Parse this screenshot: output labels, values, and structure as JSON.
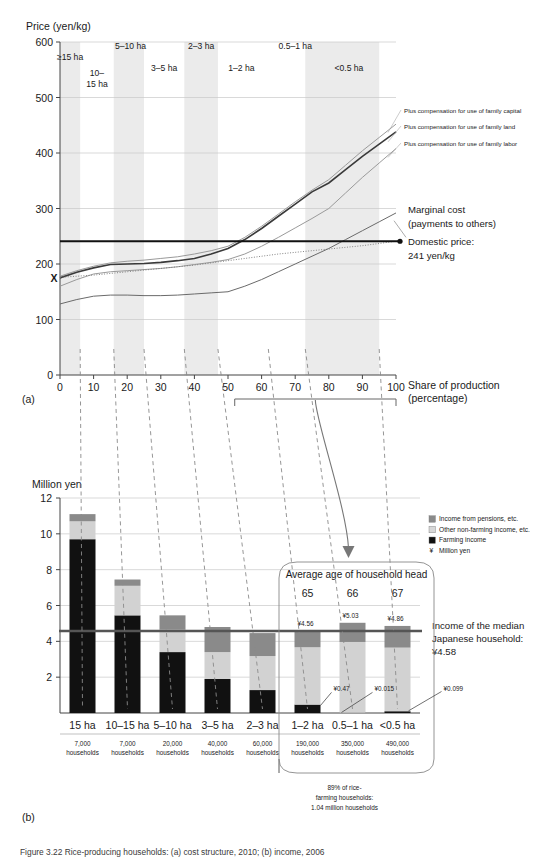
{
  "figure": {
    "caption": "Figure 3.22  Rice-producing households: (a) cost structure, 2010; (b) income, 2006",
    "panel_a_label": "(a)",
    "panel_b_label": "(b)"
  },
  "chart_data": [
    {
      "type": "line",
      "panel": "(a)",
      "title": "",
      "ylabel": "Price (yen/kg)",
      "xlabel": "Share of production (percentage)",
      "ylim": [
        0,
        600
      ],
      "xlim": [
        0,
        100
      ],
      "yticks": [
        "0",
        "100",
        "200",
        "300",
        "400",
        "500",
        "600"
      ],
      "xticks": [
        "0",
        "10",
        "20",
        "30",
        "40",
        "50",
        "60",
        "70",
        "80",
        "90",
        "100"
      ],
      "grid": true,
      "x": [
        0,
        5,
        10,
        15,
        20,
        25,
        30,
        35,
        40,
        45,
        50,
        55,
        60,
        65,
        70,
        75,
        80,
        85,
        90,
        95,
        100
      ],
      "series": [
        {
          "name": "Plus compensation for use of family capital",
          "color": "#9a9a9a",
          "values": [
            178,
            188,
            196,
            202,
            205,
            207,
            210,
            213,
            218,
            224,
            232,
            248,
            268,
            290,
            312,
            333,
            352,
            378,
            404,
            428,
            452
          ]
        },
        {
          "name": "Plus compensation for use of family land",
          "color": "#3a3a3a",
          "values": [
            175,
            185,
            193,
            199,
            200,
            201,
            203,
            206,
            210,
            218,
            228,
            244,
            264,
            286,
            308,
            330,
            346,
            370,
            394,
            416,
            438
          ]
        },
        {
          "name": "Plus compensation for use of family labor",
          "color": "#9a9a9a",
          "values": [
            160,
            172,
            182,
            186,
            188,
            190,
            192,
            195,
            199,
            203,
            208,
            218,
            232,
            248,
            265,
            282,
            300,
            328,
            356,
            382,
            408
          ]
        },
        {
          "name": "Marginal cost (payments to others)",
          "color": "#6a6a6a",
          "values": [
            128,
            136,
            142,
            144,
            144,
            143,
            143,
            144,
            146,
            148,
            150,
            160,
            172,
            186,
            200,
            214,
            228,
            244,
            260,
            276,
            292
          ]
        },
        {
          "name": "Dotted cost curve",
          "color": "#777777",
          "style": "dotted",
          "values": [
            176,
            178,
            180,
            183,
            186,
            189,
            192,
            195,
            198,
            202,
            206,
            210,
            214,
            218,
            221,
            224,
            227,
            230,
            233,
            237,
            241
          ]
        }
      ],
      "domestic_price": {
        "label_line1": "Domestic price:",
        "label_line2": "241 yen/kg",
        "value": 241
      },
      "marginal_cost_label": {
        "line1": "Marginal cost",
        "line2": "(payments to others)"
      },
      "x_marker": {
        "label": "X",
        "x": 0,
        "y": 175
      },
      "bands": [
        {
          "label": "≥15 ha",
          "x0": 0,
          "x1": 6,
          "row": 0
        },
        {
          "label_lines": [
            "10–",
            "15 ha"
          ],
          "label": "10–15 ha",
          "x0": 6,
          "x1": 16,
          "row": 1
        },
        {
          "label": "5–10 ha",
          "x0": 16,
          "x1": 25,
          "row": 0
        },
        {
          "label": "3–5 ha",
          "x0": 25,
          "x1": 37,
          "row": 1
        },
        {
          "label": "2–3 ha",
          "x0": 37,
          "x1": 47,
          "row": 0
        },
        {
          "label": "1–2 ha",
          "x0": 47,
          "x1": 62,
          "row": 1
        },
        {
          "label": "0.5–1 ha",
          "x0": 62,
          "x1": 73,
          "row": 0
        },
        {
          "label": "<0.5 ha",
          "x0": 73,
          "x1": 95,
          "row": 1
        }
      ],
      "bracket": {
        "x0": 52,
        "x1": 100
      }
    },
    {
      "type": "bar",
      "panel": "(b)",
      "stacked": true,
      "ylabel": "Million yen",
      "ylim": [
        0,
        12
      ],
      "yticks": [
        "2",
        "4",
        "6",
        "8",
        "10",
        "12"
      ],
      "categories": [
        "15 ha",
        "10–15 ha",
        "5–10 ha",
        "3–5 ha",
        "2–3 ha",
        "1–2 ha",
        "0.5–1 ha",
        "<0.5 ha"
      ],
      "households": [
        "7,000 households",
        "7,000 households",
        "20,000 households",
        "40,000 households",
        "60,000 households",
        "190,000 households",
        "350,000 households",
        "490,000 households"
      ],
      "series": [
        {
          "name": "Farming income",
          "color": "#111111",
          "values": [
            9.7,
            5.45,
            3.4,
            1.9,
            1.28,
            0.47,
            0.015,
            0.099
          ]
        },
        {
          "name": "Other non-farming income, etc.",
          "color": "#d2d2d2",
          "values": [
            1.0,
            1.65,
            1.25,
            1.5,
            1.9,
            3.2,
            3.95,
            3.55
          ]
        },
        {
          "name": "Income from pensions, etc.",
          "color": "#8a8a8a",
          "values": [
            0.4,
            0.35,
            0.8,
            1.4,
            1.28,
            0.89,
            1.07,
            1.21
          ]
        }
      ],
      "totals": [
        11.1,
        7.45,
        5.45,
        4.8,
        4.46,
        4.56,
        5.03,
        4.86
      ],
      "value_labels": [
        {
          "category": "1–2 ha",
          "text": "¥4.56",
          "kind": "total"
        },
        {
          "category": "0.5–1 ha",
          "text": "¥5.03",
          "kind": "total"
        },
        {
          "category": "<0.5 ha",
          "text": "¥4.86",
          "kind": "total"
        },
        {
          "category": "1–2 ha",
          "text": "¥0.47",
          "kind": "farming"
        },
        {
          "category": "0.5–1 ha",
          "text": "¥0.015",
          "kind": "farming"
        },
        {
          "category": "<0.5 ha",
          "text": "¥0.099",
          "kind": "farming"
        }
      ],
      "median_line": {
        "value": 4.58,
        "label_line1": "Income of the median",
        "label_line2": "Japanese household:",
        "label_line3": "¥4.58"
      },
      "callout": {
        "title": "Average age of household head",
        "ages": [
          "65",
          "66",
          "67"
        ],
        "footer_line1": "89% of rice-",
        "footer_line2": "farming households:",
        "footer_line3": "1.04 million households"
      },
      "legend": [
        {
          "label": "Income from pensions, etc.",
          "color": "#8a8a8a",
          "swatch": true
        },
        {
          "label": "Other non-farming income, etc.",
          "color": "#d8d8d8",
          "swatch": true
        },
        {
          "label": "Farming income",
          "color": "#111111",
          "swatch": true
        },
        {
          "label": "Million yen",
          "color": "",
          "swatch": false,
          "prefix": "¥"
        }
      ]
    }
  ]
}
